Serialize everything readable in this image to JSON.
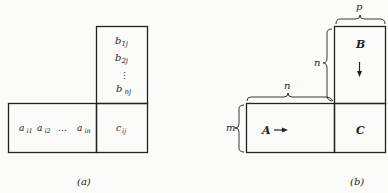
{
  "figure_a": {
    "caption": "(a)",
    "column_b": [
      "b1j",
      "b2j",
      "⋮",
      "bnj"
    ],
    "column_b_parts": [
      {
        "base": "b",
        "sub": "1j"
      },
      {
        "base": "b",
        "sub": "2j"
      },
      {
        "base": "⋮",
        "sub": ""
      },
      {
        "base": "b",
        "sub": "nj"
      }
    ],
    "row_a": [
      {
        "base": "a",
        "sub": "i1"
      },
      {
        "base": "a",
        "sub": "i2"
      },
      {
        "base": "…",
        "sub": ""
      },
      {
        "base": "a",
        "sub": "in"
      }
    ],
    "result_cell": {
      "base": "c",
      "sub": "ij"
    }
  },
  "figure_b": {
    "caption": "(b)",
    "matrix_a_label": "A",
    "matrix_b_label": "B",
    "matrix_c_label": "C",
    "dim_p": "p",
    "dim_n_vertical": "n",
    "dim_n_horizontal": "n",
    "dim_m": "m",
    "arrow_a": "right-arrow-icon",
    "arrow_b": "down-arrow-icon"
  }
}
